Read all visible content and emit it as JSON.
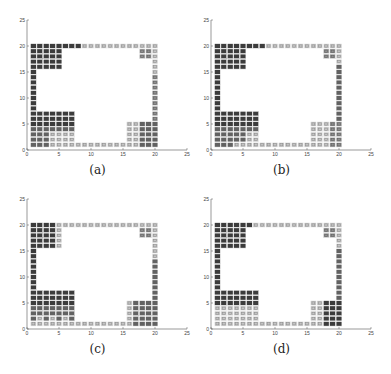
{
  "chart_data": [
    {
      "type": "heatmap",
      "panel": "a",
      "caption": "(a)",
      "xlim": [
        0,
        25
      ],
      "ylim": [
        0,
        25
      ],
      "xticks": [
        "0",
        "5",
        "10",
        "15",
        "20",
        "25"
      ],
      "yticks": [
        "0",
        "5",
        "10",
        "15",
        "20",
        "25"
      ],
      "grid": false,
      "cells_description": "Grayscale occupancy cells on a 20x20 integer grid: top row, left column, bottom row, right column, plus blocks at top-left (x1-5,y16-20), bottom-left (x1-7,y1-7), bottom-right (x16-20,y1-5), top-right (x18-20,y18-20)",
      "shade_key": {
        "d": "#3a3a3a",
        "m": "#6e6e6e",
        "g": "#9a9a9a",
        "l": "#c8c8c8"
      }
    },
    {
      "type": "heatmap",
      "panel": "b",
      "caption": "(b)",
      "xlim": [
        0,
        25
      ],
      "ylim": [
        0,
        25
      ],
      "xticks": [
        "0",
        "5",
        "10",
        "15",
        "20",
        "25"
      ],
      "yticks": [
        "0",
        "5",
        "10",
        "15",
        "20",
        "25"
      ],
      "grid": false
    },
    {
      "type": "heatmap",
      "panel": "c",
      "caption": "(c)",
      "xlim": [
        0,
        25
      ],
      "ylim": [
        0,
        25
      ],
      "xticks": [
        "0",
        "5",
        "10",
        "15",
        "20",
        "25"
      ],
      "yticks": [
        "0",
        "5",
        "10",
        "15",
        "20",
        "25"
      ],
      "grid": false
    },
    {
      "type": "heatmap",
      "panel": "d",
      "caption": "(d)",
      "xlim": [
        0,
        25
      ],
      "ylim": [
        0,
        25
      ],
      "xticks": [
        "0",
        "5",
        "10",
        "15",
        "20",
        "25"
      ],
      "yticks": [
        "0",
        "5",
        "10",
        "15",
        "20",
        "25"
      ],
      "grid": false
    }
  ],
  "panels": [
    {
      "caption": "(a)",
      "regions": {
        "topRow": "dddddddd",
        "topRowLightFrom": 9,
        "topLeft": "d",
        "leftCol": "d",
        "bottomLeftTop": "d",
        "bottomLeftBottomLightCols": [
          4,
          5,
          6,
          7
        ],
        "bottomLeftBottomLightRows": [
          1,
          2,
          3
        ],
        "bottomRow": "l",
        "bottomRight": "g",
        "rightCol": "g",
        "topRight": "g"
      }
    },
    {
      "caption": "(b)"
    },
    {
      "caption": "(c)"
    },
    {
      "caption": "(d)"
    }
  ]
}
